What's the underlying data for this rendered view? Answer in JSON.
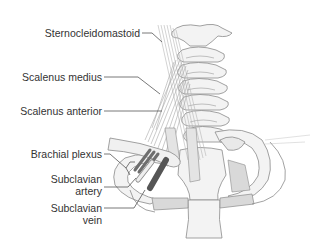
{
  "diagram": {
    "labels": [
      {
        "id": "sternocleidomastoid",
        "text": "Sternocleidomastoid"
      },
      {
        "id": "scalenus-medius",
        "text": "Scalenus medius"
      },
      {
        "id": "scalenus-anterior",
        "text": "Scalenus anterior"
      },
      {
        "id": "brachial-plexus",
        "text": "Brachial plexus"
      },
      {
        "id": "subclavian-artery",
        "line1": "Subclavian",
        "line2": "artery"
      },
      {
        "id": "subclavian-vein",
        "line1": "Subclavian",
        "line2": "vein"
      }
    ],
    "colors": {
      "bone_fill": "#f2f2f2",
      "bone_stroke": "#8a8a8a",
      "muscle": "#b8b8b8",
      "cartilage": "#d9d9d9",
      "nerve": "#6e6e6e",
      "artery": "#e6e6e6",
      "vein": "#5a5a5a",
      "leader_line": "#555555",
      "text": "#333333"
    }
  }
}
